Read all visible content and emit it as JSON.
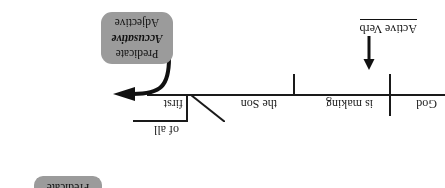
{
  "figure": {
    "type": "sentence-diagram",
    "orientation": "rotated-180",
    "baseline_words": [
      {
        "id": "god",
        "text": "God",
        "role": "subject"
      },
      {
        "id": "is-making",
        "text": "is making",
        "role": "verb"
      },
      {
        "id": "the-son",
        "text": "the Son",
        "role": "direct-object"
      },
      {
        "id": "first",
        "text": "first",
        "role": "predicate-accusative-adjective"
      }
    ],
    "branch_words": [
      {
        "id": "of-all",
        "text": "of all",
        "role": "prepositional-branch"
      }
    ],
    "annotations": [
      {
        "id": "active-verb",
        "text": "Active Verb",
        "underlined": true,
        "points_to": "is making"
      }
    ],
    "callouts": [
      {
        "id": "predicate-accusative-adjective",
        "lines": [
          {
            "text": "Predicate",
            "emphasis": false
          },
          {
            "text": "Accusative",
            "emphasis": true
          },
          {
            "text": "Adjective",
            "emphasis": false
          }
        ],
        "points_to": "first",
        "fill": "#9b9b9b"
      },
      {
        "id": "predicate-top",
        "lines": [
          {
            "text": "Predicate",
            "emphasis": false
          }
        ],
        "clipped": true,
        "fill": "#9b9b9b"
      }
    ],
    "colors": {
      "ink": "#1a1a1a",
      "callout_fill": "#9b9b9b",
      "background": "#ffffff"
    }
  }
}
